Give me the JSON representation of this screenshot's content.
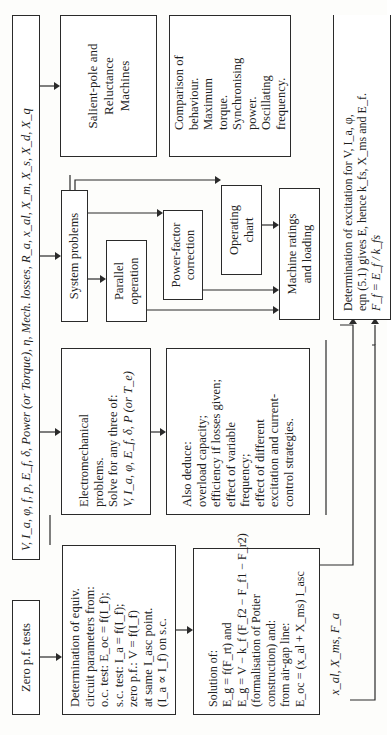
{
  "diagram": {
    "orientation": "rotated -90deg (text reads bottom-to-top)",
    "parameters_bar": {
      "text": "V, I_a, φ, f, p, E_f, δ, Power (or Torque), η, Mech. losses, R_a, x_al, X_m, X_s, X_d, X_q"
    },
    "zero_pf_tests": {
      "text": "Zero p.f. tests"
    },
    "equiv_circuit": {
      "lines": [
        "Determination of equiv.",
        "circuit parameters from:",
        "o.c. test: E_oc = f(I_f);",
        "s.c. test: I_a = f(I_f);",
        "zero p.f.: V = f(I_f)",
        "at same I_asc point.",
        "(I_a ∝ I_f) on s.c."
      ]
    },
    "solution": {
      "lines": [
        "Solution of:",
        "E_g = f(F_rt) and",
        "E_g = V − k_f (F_f2 − F_f1 − F_r2)",
        "(formalisation of Potier",
        "construction) and:",
        "from air-gap line:",
        "E_oc = (x_al + X_ms) I_asc"
      ]
    },
    "outputs_label": {
      "text": "x_al, X_ms, F_a"
    },
    "electromechanical": {
      "lines": [
        "Electromechanical",
        "problems.",
        "Solve for any three of:",
        "V, I_a, φ, E_f, δ, P (or T_e)"
      ]
    },
    "also_deduce": {
      "lines": [
        "Also deduce:",
        "overload capacity;",
        "efficiency if losses given;",
        "effect of variable",
        "frequency;",
        "effect of different",
        "excitation and current-",
        "control strategies."
      ]
    },
    "system_problems": {
      "text": "System problems"
    },
    "parallel_operation": {
      "lines": [
        "Parallel",
        "operation"
      ]
    },
    "power_factor": {
      "lines": [
        "Power-factor",
        "correction"
      ]
    },
    "operating_chart": {
      "lines": [
        "Operating",
        "chart"
      ]
    },
    "machine_ratings": {
      "lines": [
        "Machine ratings",
        "and loading"
      ]
    },
    "salient_pole": {
      "lines": [
        "Salient-pole and",
        "Reluctance",
        "Machines"
      ]
    },
    "comparison": {
      "lines": [
        "Comparison of",
        "behaviour.",
        "Maximum",
        "torque.",
        "Synchronising",
        "power.",
        "Oscillating",
        "frequency."
      ]
    },
    "excitation": {
      "lines": [
        "Determination of excitation for V, I_a, φ,",
        "eqn (5.1) gives E, hence k_fs, X_ms and E_f.",
        "F_f = E_f / k_fs"
      ]
    }
  }
}
